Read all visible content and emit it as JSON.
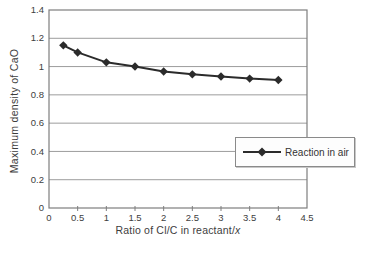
{
  "figure": {
    "background_color": "#ffffff",
    "text_color": "#3d3d3d"
  },
  "colors": {
    "series_line": "#2b2b2b",
    "gridline": "#9c9c9c",
    "plot_border": "#7e7e7e",
    "tick_text": "#404040",
    "legend_border": "#8a8a8a",
    "legend_background": "#fdfdfd"
  },
  "chart_data": {
    "type": "line",
    "xlabel": "Ratio of Cl/C in reactant/x",
    "xlabel_prefix": "Ratio of Cl/C in reactant/",
    "xlabel_italic": "x",
    "ylabel": "Maximum density of CaO",
    "xlim": [
      0,
      4.5
    ],
    "ylim": [
      0,
      1.4
    ],
    "x_ticks": [
      0,
      0.5,
      1,
      1.5,
      2,
      2.5,
      3,
      3.5,
      4,
      4.5
    ],
    "x_tick_labels": [
      "0",
      "0.5",
      "1",
      "1.5",
      "2",
      "2.5",
      "3",
      "3.5",
      "4",
      "4.5"
    ],
    "y_ticks": [
      0,
      0.2,
      0.4,
      0.6,
      0.8,
      1,
      1.2,
      1.4
    ],
    "y_tick_labels": [
      "0",
      "0.2",
      "0.4",
      "0.6",
      "0.8",
      "1",
      "1.2",
      "1.4"
    ],
    "grid": "horizontal",
    "legend_position": "middle-right overlapping plot edge",
    "x": [
      0.25,
      0.5,
      1,
      1.5,
      2,
      2.5,
      3,
      3.5,
      4
    ],
    "series": [
      {
        "name": "Reaction in air",
        "marker": "diamond",
        "color": "#2b2b2b",
        "values": [
          1.15,
          1.1,
          1.03,
          1.0,
          0.965,
          0.945,
          0.93,
          0.915,
          0.905
        ]
      }
    ]
  }
}
